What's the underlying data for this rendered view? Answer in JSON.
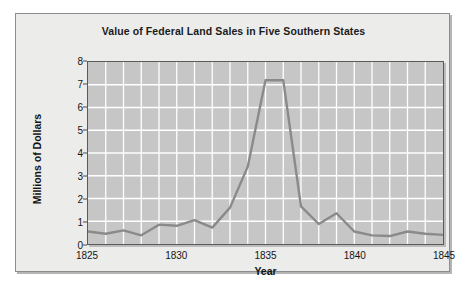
{
  "figure": {
    "title": "Value of Federal Land Sales in Five Southern States",
    "background_color": "#ececeb",
    "plot_background_color": "#c6c6c6",
    "grid_color": "#ffffff",
    "line_color": "#8a8a8a",
    "axis_color": "#5a5a5a"
  },
  "chart_data": {
    "type": "line",
    "title": "Value of Federal Land Sales in Five Southern States",
    "xlabel": "Year",
    "ylabel": "Millions of Dollars",
    "xlim": [
      1825,
      1845
    ],
    "ylim": [
      0,
      8
    ],
    "grid": true,
    "legend": null,
    "x_tick_labels": [
      "1825",
      "1830",
      "1835",
      "1840",
      "1845"
    ],
    "x_tick_values": [
      1825,
      1830,
      1835,
      1840,
      1845
    ],
    "y_tick_labels": [
      "0",
      "1",
      "2",
      "3",
      "4",
      "5",
      "6",
      "7",
      "8"
    ],
    "y_tick_values": [
      0,
      1,
      2,
      3,
      4,
      5,
      6,
      7,
      8
    ],
    "x": [
      1825,
      1826,
      1827,
      1828,
      1829,
      1830,
      1831,
      1832,
      1833,
      1834,
      1835,
      1836,
      1837,
      1838,
      1839,
      1840,
      1841,
      1842,
      1843,
      1844,
      1845
    ],
    "values": [
      0.55,
      0.45,
      0.6,
      0.38,
      0.85,
      0.8,
      1.05,
      0.72,
      1.6,
      3.4,
      7.2,
      7.2,
      1.65,
      0.88,
      1.35,
      0.55,
      0.38,
      0.35,
      0.55,
      0.45,
      0.4
    ],
    "series": [
      {
        "name": "Value of Federal Land Sales",
        "values": [
          0.55,
          0.45,
          0.6,
          0.38,
          0.85,
          0.8,
          1.05,
          0.72,
          1.6,
          3.4,
          7.2,
          7.2,
          1.65,
          0.88,
          1.35,
          0.55,
          0.38,
          0.35,
          0.55,
          0.45,
          0.4
        ]
      }
    ]
  }
}
